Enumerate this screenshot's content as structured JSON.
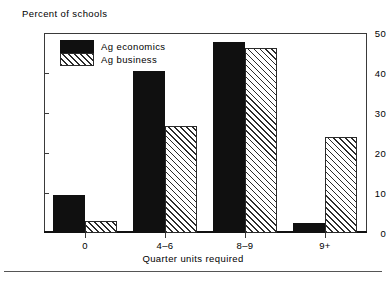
{
  "chart_data": {
    "type": "bar",
    "title": "",
    "ylabel": "Percent of schools",
    "xlabel": "Quarter units required",
    "categories": [
      "0",
      "4–6",
      "8–9",
      "9+"
    ],
    "series": [
      {
        "name": "Ag  economics",
        "pattern": "solid",
        "values": [
          9.5,
          40.5,
          47.8,
          2.5
        ]
      },
      {
        "name": "Ag  business",
        "pattern": "hatch",
        "values": [
          3.0,
          26.8,
          46.2,
          24.0
        ]
      }
    ],
    "ylim": [
      0,
      50
    ],
    "yticks": [
      0,
      10,
      20,
      30,
      40,
      50
    ],
    "ytick_labels": [
      "0",
      "10",
      "20",
      "30",
      "40",
      "50"
    ],
    "grid": false,
    "legend_position": "upper-left-inside"
  },
  "legend": {
    "entries": [
      {
        "label": "Ag  economics",
        "swatch": "solid"
      },
      {
        "label": "Ag  business",
        "swatch": "hatch"
      }
    ]
  },
  "colors": {
    "series_solid": "#101010",
    "series_hatch_line": "#2b2b2b",
    "axis": "#3a3a3a",
    "background": "#ffffff",
    "rule": "#555555"
  }
}
